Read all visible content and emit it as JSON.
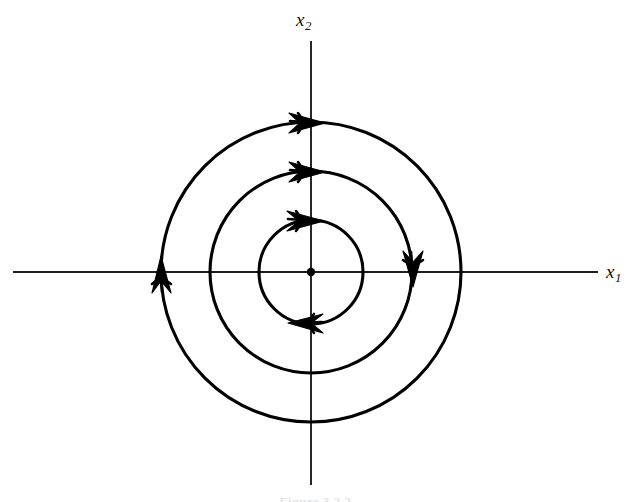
{
  "figure": {
    "caption": "Figure 3.2.2",
    "background_color": "#ffffff",
    "stroke_color": "#000000",
    "axis_color": "#1d1d1d",
    "width": 631,
    "height": 502
  },
  "axes": {
    "x_label": "x",
    "x_label_sub": "1",
    "y_label": "x",
    "y_label_sub": "2",
    "x_axis_y": 272,
    "x_axis_start": 13,
    "x_axis_end": 598,
    "y_axis_x": 311,
    "y_axis_start": 41,
    "y_axis_end": 485
  },
  "chart_data": {
    "type": "scatter",
    "title": "",
    "subtitle": "",
    "xlabel": "x1",
    "ylabel": "x2",
    "grid": false,
    "legend": null,
    "equilibrium": {
      "name": "center",
      "x": 0,
      "y": 0,
      "pixel_x": 311,
      "pixel_y": 272,
      "dot_radius": 4.2
    },
    "flow_direction": "clockwise",
    "orbits": [
      {
        "name": "inner-orbit",
        "radius": 52,
        "center_x": 311,
        "center_y": 272,
        "arrow_angles_deg": [
          90,
          270
        ]
      },
      {
        "name": "middle-orbit",
        "radius": 101,
        "center_x": 311,
        "center_y": 272,
        "arrow_angles_deg": [
          90,
          0
        ]
      },
      {
        "name": "outer-orbit",
        "radius": 150,
        "center_x": 311,
        "center_y": 272,
        "arrow_angles_deg": [
          90,
          180
        ]
      }
    ],
    "arrows": [
      {
        "name": "outer-top-arrow",
        "pixel_x": 311,
        "pixel_y": 122,
        "direction": "right"
      },
      {
        "name": "middle-top-arrow",
        "pixel_x": 311,
        "pixel_y": 171,
        "direction": "right"
      },
      {
        "name": "inner-top-arrow",
        "pixel_x": 311,
        "pixel_y": 220,
        "direction": "right"
      },
      {
        "name": "inner-bottom-arrow",
        "pixel_x": 305,
        "pixel_y": 323,
        "direction": "left"
      },
      {
        "name": "middle-right-arrow",
        "pixel_x": 412,
        "pixel_y": 272,
        "direction": "down"
      },
      {
        "name": "outer-left-arrow",
        "pixel_x": 161,
        "pixel_y": 272,
        "direction": "up"
      }
    ],
    "xlim": [
      -1.95,
      1.91
    ],
    "ylim": [
      -1.42,
      1.48
    ]
  }
}
